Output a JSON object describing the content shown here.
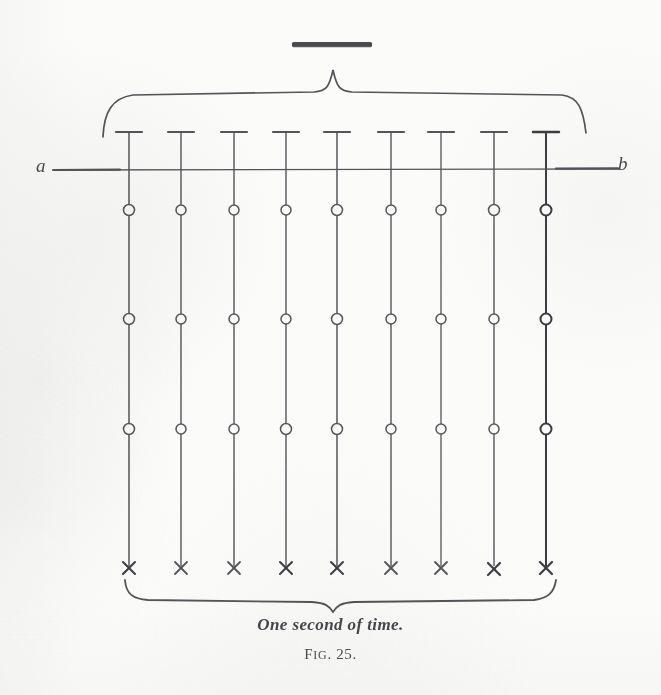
{
  "figure": {
    "caption": "One second of time.",
    "figure_number_prefix": "F",
    "figure_number_rest": "IG",
    "figure_number_suffix": ". 25.",
    "figure_number_full": "Fig. 25.",
    "axis": {
      "left_label": "a",
      "right_label": "b",
      "line_y": 170,
      "x_start": 52,
      "x_end": 620
    },
    "top_bar": {
      "name": "solid-rule",
      "x": 292,
      "width": 80,
      "y": 42,
      "height": 5,
      "color": "#4a4a50"
    },
    "upper_brace": {
      "x_start": 103,
      "x_end": 585,
      "peak_x": 333,
      "peak_y": 70,
      "body_y": 96
    },
    "lower_brace": {
      "x_start": 125,
      "x_end": 555,
      "peak_x": 333,
      "peak_y": 612,
      "body_y": 595
    },
    "columns": {
      "count": 9,
      "x_positions": [
        129,
        181,
        234,
        286,
        337,
        391,
        441,
        494,
        546
      ],
      "top_bar_y": 132,
      "top_bar_half_width": 13,
      "line_top_y": 132,
      "line_bottom_y": 566,
      "bold_column_index": 8
    },
    "node_rows": {
      "circle_rows_y": [
        210,
        319,
        429
      ],
      "circle_radius": 5.5,
      "cross_row_y": 568,
      "cross_half_size": 6
    },
    "colors": {
      "ink": "#54545a",
      "ink_strong": "#3c3c42",
      "paper": "#fbfbfa"
    }
  }
}
